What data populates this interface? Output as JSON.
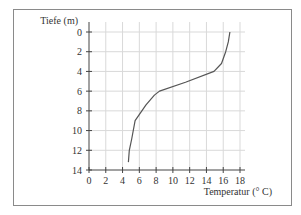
{
  "chart_data": {
    "type": "line",
    "title": "",
    "xlabel": "Temperatur (° C)",
    "ylabel": "Tiefe (m)",
    "xlim": [
      0,
      18
    ],
    "ylim": [
      14,
      0
    ],
    "y_inverted": true,
    "grid": true,
    "x_ticks": [
      0,
      2,
      4,
      6,
      8,
      10,
      12,
      14,
      16,
      18
    ],
    "y_ticks": [
      0,
      2,
      4,
      6,
      8,
      10,
      12,
      14
    ],
    "x_tick_labels": [
      "0",
      "2",
      "4",
      "6",
      "8",
      "10",
      "12",
      "14",
      "16",
      "18"
    ],
    "y_tick_labels": [
      "0",
      "2",
      "4",
      "6",
      "8",
      "10",
      "12",
      "14"
    ],
    "series": [
      {
        "name": "Temperaturprofil",
        "color": "#555555",
        "points": [
          {
            "temp": 16.8,
            "depth": 0.0
          },
          {
            "temp": 16.6,
            "depth": 1.0
          },
          {
            "temp": 16.3,
            "depth": 2.0
          },
          {
            "temp": 15.8,
            "depth": 3.2
          },
          {
            "temp": 14.9,
            "depth": 4.0
          },
          {
            "temp": 11.5,
            "depth": 5.1
          },
          {
            "temp": 8.4,
            "depth": 6.0
          },
          {
            "temp": 7.8,
            "depth": 6.4
          },
          {
            "temp": 6.8,
            "depth": 7.4
          },
          {
            "temp": 5.5,
            "depth": 9.0
          },
          {
            "temp": 5.1,
            "depth": 10.8
          },
          {
            "temp": 4.8,
            "depth": 12.0
          },
          {
            "temp": 4.7,
            "depth": 13.2
          }
        ]
      }
    ]
  }
}
